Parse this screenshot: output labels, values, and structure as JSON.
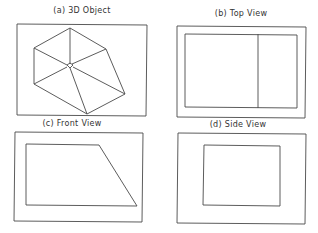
{
  "panels": [
    {
      "id": "a",
      "title": "(a) 3D Object"
    },
    {
      "id": "b",
      "title": "(b) Top View"
    },
    {
      "id": "c",
      "title": "(c) Front View"
    },
    {
      "id": "d",
      "title": "(d) Side View"
    }
  ],
  "colors": {
    "stroke": "#444444",
    "background": "#ffffff"
  }
}
